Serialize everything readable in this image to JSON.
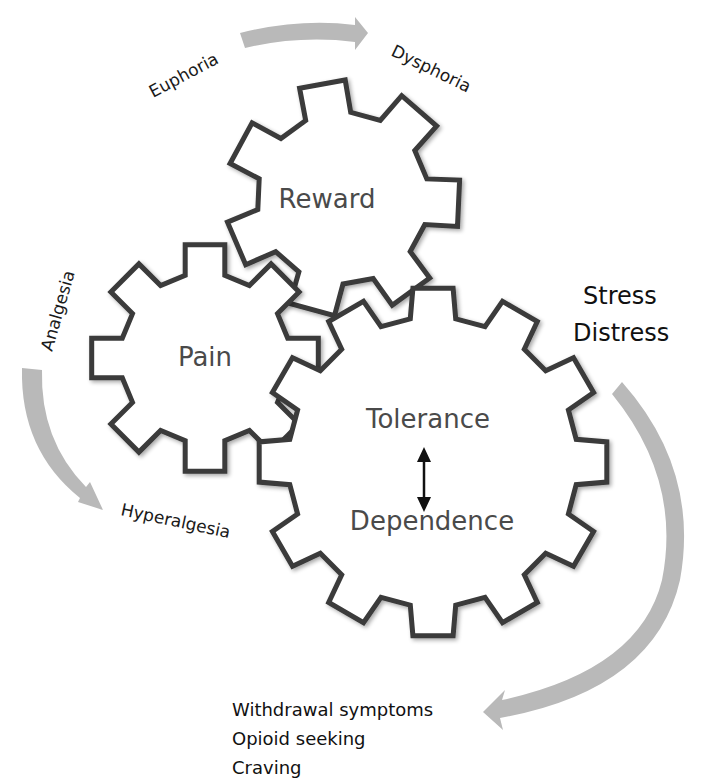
{
  "diagram": {
    "gears": [
      {
        "id": "reward",
        "label": "Reward",
        "teeth": 7,
        "cx": 343,
        "cy": 198,
        "r_outer": 118,
        "r_inner": 86
      },
      {
        "id": "pain",
        "label": "Pain",
        "teeth": 8,
        "cx": 205,
        "cy": 358,
        "r_outer": 115,
        "r_inner": 85
      },
      {
        "id": "tolerance-dependence",
        "label_top": "Tolerance",
        "label_bottom": "Dependence",
        "teeth": 12,
        "cx": 433,
        "cy": 462,
        "r_outer": 175,
        "r_inner": 145
      }
    ],
    "labels": {
      "euphoria": "Euphoria",
      "dysphoria": "Dysphoria",
      "analgesia": "Analgesia",
      "hyperalgesia": "Hyperalgesia",
      "stress": "Stress",
      "distress": "Distress",
      "outcomes": [
        "Withdrawal symptoms",
        "Opioid seeking",
        "Craving"
      ]
    },
    "arrows": [
      {
        "id": "euphoria-to-dysphoria",
        "direction": "right"
      },
      {
        "id": "analgesia-to-hyperalgesia",
        "direction": "down"
      },
      {
        "id": "stress-to-withdrawal",
        "direction": "down-left"
      },
      {
        "id": "tolerance-dependence-bidirectional",
        "direction": "up-down"
      }
    ],
    "colors": {
      "gear_stroke": "#3a3a3a",
      "arrow_fill": "#b9b9b9",
      "text": "#1a1a1a",
      "gear_text": "#4a4a4a"
    }
  }
}
